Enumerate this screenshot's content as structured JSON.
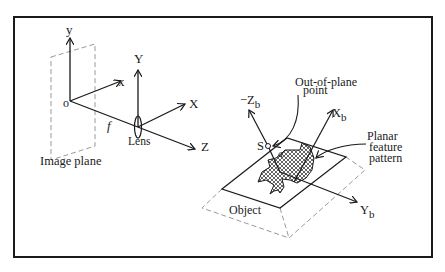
{
  "diagram": {
    "camera": {
      "image_plane_axes": {
        "y": "y",
        "x": "x",
        "origin": "o"
      },
      "lens_axes": {
        "Y": "Y",
        "X": "X",
        "Z": "Z"
      },
      "focal_length": "f",
      "lens_label": "Lens",
      "image_plane_label": "Image plane"
    },
    "object": {
      "axes": {
        "neg_z": "−Z",
        "neg_z_sub": "b",
        "x": "X",
        "x_sub": "b",
        "y": "Y",
        "y_sub": "b"
      },
      "point_label": "S",
      "angle_label": "a",
      "out_of_plane_label_line1": "Out-of-plane",
      "out_of_plane_label_line2": "point",
      "planar_label_line1": "Planar",
      "planar_label_line2": "feature",
      "planar_label_line3": "pattern",
      "object_label": "Object"
    }
  }
}
